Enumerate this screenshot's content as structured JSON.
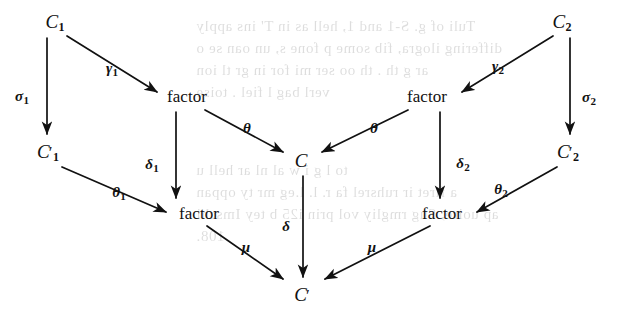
{
  "diagram": {
    "kind": "commutative-diagram",
    "title": "",
    "objects": [
      {
        "id": "C1",
        "base": "C",
        "sub": "1",
        "prime": false,
        "label": "C₁",
        "x": 55,
        "y": 22
      },
      {
        "id": "C1prime",
        "base": "C",
        "sub": "1",
        "prime": true,
        "label": "C₁′",
        "x": 48,
        "y": 152
      },
      {
        "id": "factorUL",
        "base": "factor",
        "sub": "",
        "prime": false,
        "label": "factor",
        "x": 187,
        "y": 96
      },
      {
        "id": "factorLL",
        "base": "factor",
        "sub": "",
        "prime": false,
        "label": "factor",
        "x": 199,
        "y": 213
      },
      {
        "id": "C",
        "base": "C",
        "sub": "",
        "prime": false,
        "label": "C",
        "x": 301,
        "y": 160
      },
      {
        "id": "Cprime",
        "base": "C",
        "sub": "",
        "prime": true,
        "label": "C′",
        "x": 302,
        "y": 294
      },
      {
        "id": "factorUR",
        "base": "factor",
        "sub": "",
        "prime": false,
        "label": "factor",
        "x": 427,
        "y": 96
      },
      {
        "id": "factorLR",
        "base": "factor",
        "sub": "",
        "prime": false,
        "label": "factor",
        "x": 442,
        "y": 213
      },
      {
        "id": "C2",
        "base": "C",
        "sub": "2",
        "prime": false,
        "label": "C₂",
        "x": 562,
        "y": 22
      },
      {
        "id": "C2prime",
        "base": "C",
        "sub": "2",
        "prime": true,
        "label": "C₂′",
        "x": 568,
        "y": 152
      }
    ],
    "arrows": [
      {
        "id": "gamma1",
        "from": "C1",
        "to": "factorUL",
        "label": "γ",
        "sub": "1",
        "lx": 112,
        "ly": 69,
        "x1": 67,
        "y1": 36,
        "x2": 157,
        "y2": 92
      },
      {
        "id": "sigma1",
        "from": "C1",
        "to": "C1prime",
        "label": "σ",
        "sub": "1",
        "lx": 22,
        "ly": 97,
        "x1": 47,
        "y1": 38,
        "x2": 47,
        "y2": 134
      },
      {
        "id": "theta_left",
        "from": "factorUL",
        "to": "C",
        "label": "θ",
        "sub": "",
        "lx": 247,
        "ly": 128,
        "x1": 205,
        "y1": 110,
        "x2": 283,
        "y2": 152
      },
      {
        "id": "delta1",
        "from": "factorUL",
        "to": "factorLL",
        "label": "δ",
        "sub": "1",
        "lx": 152,
        "ly": 165,
        "x1": 176,
        "y1": 112,
        "x2": 176,
        "y2": 198
      },
      {
        "id": "theta1",
        "from": "C1prime",
        "to": "factorLL",
        "label": "θ",
        "sub": "1",
        "lx": 119,
        "ly": 193,
        "x1": 62,
        "y1": 167,
        "x2": 166,
        "y2": 212
      },
      {
        "id": "mu_left",
        "from": "factorLL",
        "to": "Cprime",
        "label": "μ",
        "sub": "",
        "lx": 246,
        "ly": 247,
        "x1": 207,
        "y1": 226,
        "x2": 283,
        "y2": 279
      },
      {
        "id": "delta",
        "from": "C",
        "to": "Cprime",
        "label": "δ",
        "sub": "",
        "lx": 286,
        "ly": 226,
        "x1": 303,
        "y1": 176,
        "x2": 303,
        "y2": 277
      },
      {
        "id": "gamma2",
        "from": "C2",
        "to": "factorUR",
        "label": "γ",
        "sub": "2",
        "lx": 498,
        "ly": 67,
        "x1": 553,
        "y1": 36,
        "x2": 462,
        "y2": 92
      },
      {
        "id": "sigma2",
        "from": "C2",
        "to": "C2prime",
        "label": "σ",
        "sub": "2",
        "lx": 589,
        "ly": 98,
        "x1": 570,
        "y1": 38,
        "x2": 570,
        "y2": 134
      },
      {
        "id": "theta_right",
        "from": "factorUR",
        "to": "C",
        "label": "θ",
        "sub": "",
        "lx": 374,
        "ly": 128,
        "x1": 408,
        "y1": 110,
        "x2": 322,
        "y2": 152
      },
      {
        "id": "delta2",
        "from": "factorUR",
        "to": "factorLR",
        "label": "δ",
        "sub": "2",
        "lx": 463,
        "ly": 164,
        "x1": 440,
        "y1": 112,
        "x2": 440,
        "y2": 198
      },
      {
        "id": "theta2",
        "from": "C2prime",
        "to": "factorLR",
        "label": "θ",
        "sub": "2",
        "lx": 501,
        "ly": 190,
        "x1": 557,
        "y1": 167,
        "x2": 477,
        "y2": 212
      },
      {
        "id": "mu_right",
        "from": "factorLR",
        "to": "Cprime",
        "label": "μ",
        "sub": "",
        "lx": 372,
        "ly": 247,
        "x1": 430,
        "y1": 226,
        "x2": 325,
        "y2": 279
      }
    ],
    "colors": {
      "ink": "#111111",
      "paper": "#ffffff",
      "bleed": "#000000"
    },
    "bleed_text": [
      {
        "text": "Tuli of g. S-1 and 1, hell as  in   T'   ins  apply",
        "x": 196,
        "y": 18
      },
      {
        "text": "differing ilogra, fib  some  p  fone s,  un  oan se o",
        "x": 196,
        "y": 40
      },
      {
        "text": "ar g  th  . th oo  ser  mi  for   in  gr   tl  ion",
        "x": 196,
        "y": 62
      },
      {
        "text": "verl  bag l  fiel  .  toise",
        "x": 196,
        "y": 84
      },
      {
        "text": "to l g i w  al  nl  ar  hell  u",
        "x": 196,
        "y": 162
      },
      {
        "text": "a firet ir  ruhsrel fa r. l. l.eg  mr  ty  oppan",
        "x": 196,
        "y": 184
      },
      {
        "text": "ap uoire, Sug rmgliy  vol prin  i25  b  tey  Imschi",
        "x": 196,
        "y": 206
      },
      {
        "text": "108.",
        "x": 196,
        "y": 228
      }
    ]
  }
}
